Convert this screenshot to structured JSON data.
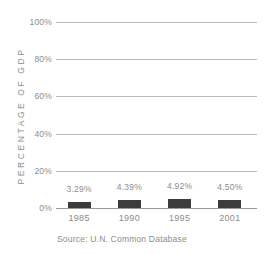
{
  "chart_data": {
    "type": "bar",
    "title": "",
    "subtitle": "",
    "xlabel": "",
    "ylabel": "PERCENTAGE OF GDP",
    "categories": [
      "1985",
      "1990",
      "1995",
      "2001"
    ],
    "values": [
      3.29,
      4.39,
      4.92,
      4.5
    ],
    "value_labels": [
      "3.29%",
      "4.39%",
      "4.92%",
      "4.50%"
    ],
    "ylim": [
      0,
      100
    ],
    "yticks": [
      0,
      20,
      40,
      60,
      80,
      100
    ],
    "ytick_labels": [
      "0%",
      "20%",
      "40%",
      "60%",
      "80%",
      "100%"
    ],
    "grid": true,
    "legend": "none",
    "series": [
      {
        "name": "Percentage of GDP",
        "values": [
          3.29,
          4.39,
          4.92,
          4.5
        ]
      }
    ],
    "annotations": [
      "Source: U.N. Common Database"
    ],
    "colors": {
      "bar": "#3c3c3c",
      "gridline": "#b9b9b9",
      "axis": "#9a9a9a",
      "text": "#8c8c8c",
      "background": "#ffffff"
    }
  },
  "source_note": "Source: U.N. Common Database"
}
